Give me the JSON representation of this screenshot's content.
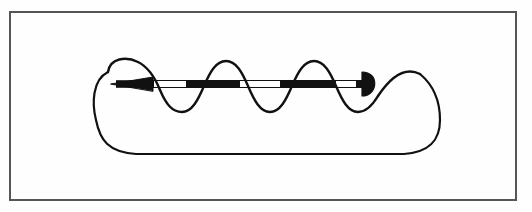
{
  "figure": {
    "title": "Helical coil with axial double-headed vector arrow",
    "kind": "line-drawing",
    "background_color": "#fefefe",
    "ink_color": "#111111",
    "frame": {
      "name": "border-frame",
      "color": "#555555",
      "x": 9,
      "y": 11,
      "width": 508,
      "height": 190,
      "stroke_width": 2
    },
    "canvas": {
      "width": 532,
      "height": 212
    },
    "axis": {
      "name": "axis-line",
      "y": 84,
      "x_start": 112,
      "x_end": 370,
      "label": ""
    },
    "arrow": {
      "name": "axial-vector-arrow",
      "shaft_color": "#111111",
      "shaft_outline_color": "#111111",
      "left_head": {
        "name": "left-arrowhead",
        "shape": "sharp-triangle",
        "direction": "left",
        "tip_x": 112,
        "base_x": 152,
        "half_height": 7
      },
      "right_head": {
        "name": "right-arrowhead",
        "shape": "half-disc",
        "direction": "right",
        "flat_x": 362,
        "tip_x": 379,
        "radius": 12
      },
      "filled_segments": [
        {
          "x_start": 116,
          "x_end": 154
        },
        {
          "x_start": 186,
          "x_end": 240
        },
        {
          "x_start": 280,
          "x_end": 336
        }
      ],
      "hollow_segments": [
        {
          "x_start": 154,
          "x_end": 186
        },
        {
          "x_start": 240,
          "x_end": 280
        },
        {
          "x_start": 336,
          "x_end": 362
        }
      ]
    },
    "helix": {
      "name": "helix-coil",
      "turns": 3,
      "wave_start_x": 108,
      "wave_end_x": 372,
      "peak_y": 61,
      "trough_y": 111,
      "center_y": 86,
      "amplitude": 25,
      "period": 88,
      "peaks_x": [
        138,
        226,
        314
      ],
      "troughs_x": [
        182,
        270,
        358
      ],
      "stroke_width": 2.4
    },
    "loop": {
      "name": "closed-return-loop",
      "left_x": 96,
      "right_x": 440,
      "bottom_y": 153,
      "corner_radius": 40,
      "stroke_width": 2.2
    }
  }
}
